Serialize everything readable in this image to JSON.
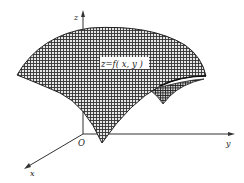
{
  "figure": {
    "surface_label": "z=f( x, y )",
    "axes": {
      "x_label": "x",
      "y_label": "y",
      "z_label": "z",
      "origin_label": "O"
    },
    "colors": {
      "ink": "#222222",
      "surface_fill": "#d8d8d8",
      "hatch": "#333333",
      "background": "#ffffff"
    }
  }
}
